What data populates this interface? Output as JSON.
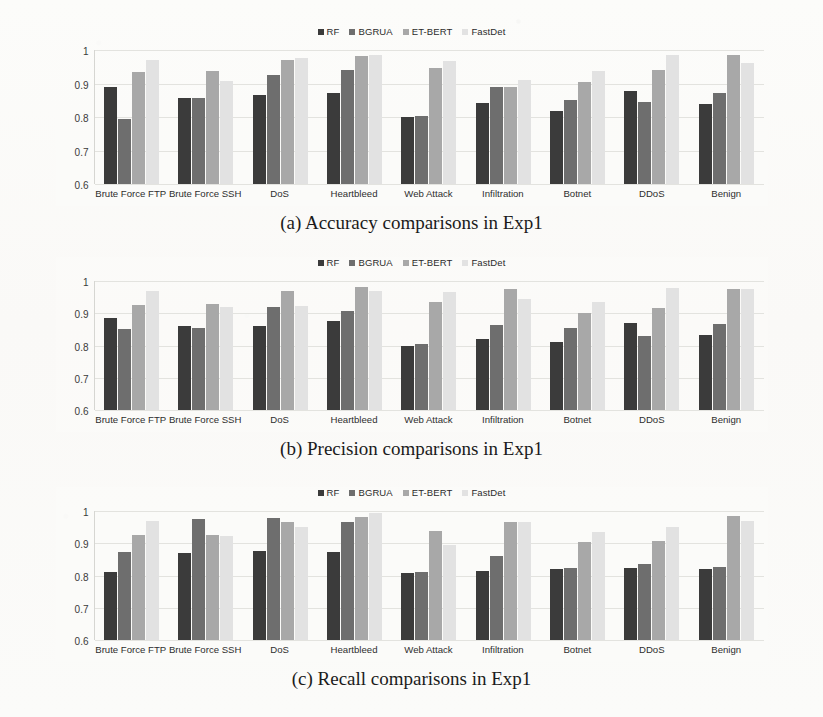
{
  "figure": {
    "series_names": [
      "RF",
      "BGRUA",
      "ET-BERT",
      "FastDet"
    ],
    "series_colors": [
      "#3b3b3b",
      "#6e6e6e",
      "#a8a8a8",
      "#e2e2e2"
    ],
    "categories": [
      "Brute Force FTP",
      "Brute Force SSH",
      "DoS",
      "Heartbleed",
      "Web Attack",
      "Infiltration",
      "Botnet",
      "DDoS",
      "Benign"
    ],
    "yticks": [
      "1",
      "0.9",
      "0.8",
      "0.7",
      "0.6"
    ],
    "captions": {
      "a": "(a) Accuracy comparisons in Exp1",
      "b": "(b) Precision comparisons in Exp1",
      "c": "(c) Recall comparisons in Exp1"
    }
  },
  "chart_data": [
    {
      "type": "bar",
      "title": "(a) Accuracy comparisons in Exp1",
      "xlabel": "",
      "ylabel": "",
      "ylim": [
        0.6,
        1.0
      ],
      "grid": true,
      "legend_position": "top-center",
      "categories": [
        "Brute Force FTP",
        "Brute Force SSH",
        "DoS",
        "Heartbleed",
        "Web Attack",
        "Infiltration",
        "Botnet",
        "DDoS",
        "Benign"
      ],
      "series": [
        {
          "name": "RF",
          "values": [
            0.89,
            0.858,
            0.865,
            0.872,
            0.799,
            0.841,
            0.817,
            0.877,
            0.838
          ]
        },
        {
          "name": "BGRUA",
          "values": [
            0.795,
            0.857,
            0.925,
            0.94,
            0.804,
            0.891,
            0.851,
            0.846,
            0.871
          ]
        },
        {
          "name": "ET-BERT",
          "values": [
            0.934,
            0.938,
            0.97,
            0.981,
            0.946,
            0.891,
            0.906,
            0.94,
            0.985
          ]
        },
        {
          "name": "FastDet",
          "values": [
            0.97,
            0.909,
            0.975,
            0.984,
            0.966,
            0.91,
            0.936,
            0.984,
            0.962
          ]
        }
      ]
    },
    {
      "type": "bar",
      "title": "(b) Precision comparisons in Exp1",
      "xlabel": "",
      "ylabel": "",
      "ylim": [
        0.6,
        1.0
      ],
      "grid": true,
      "legend_position": "top-center",
      "categories": [
        "Brute Force FTP",
        "Brute Force SSH",
        "DoS",
        "Heartbleed",
        "Web Attack",
        "Infiltration",
        "Botnet",
        "DDoS",
        "Benign"
      ],
      "series": [
        {
          "name": "RF",
          "values": [
            0.885,
            0.86,
            0.861,
            0.875,
            0.8,
            0.821,
            0.811,
            0.871,
            0.832
          ]
        },
        {
          "name": "BGRUA",
          "values": [
            0.852,
            0.855,
            0.92,
            0.906,
            0.806,
            0.863,
            0.854,
            0.828,
            0.868
          ]
        },
        {
          "name": "ET-BERT",
          "values": [
            0.925,
            0.93,
            0.97,
            0.982,
            0.935,
            0.975,
            0.902,
            0.915,
            0.974
          ]
        },
        {
          "name": "FastDet",
          "values": [
            0.97,
            0.92,
            0.922,
            0.968,
            0.967,
            0.943,
            0.935,
            0.978,
            0.974
          ]
        }
      ]
    },
    {
      "type": "bar",
      "title": "(c) Recall comparisons in Exp1",
      "xlabel": "",
      "ylabel": "",
      "ylim": [
        0.6,
        1.0
      ],
      "grid": true,
      "legend_position": "top-center",
      "categories": [
        "Brute Force FTP",
        "Brute Force SSH",
        "DoS",
        "Heartbleed",
        "Web Attack",
        "Infiltration",
        "Botnet",
        "DDoS",
        "Benign"
      ],
      "series": [
        {
          "name": "RF",
          "values": [
            0.812,
            0.871,
            0.877,
            0.872,
            0.808,
            0.815,
            0.82,
            0.824,
            0.82
          ]
        },
        {
          "name": "BGRUA",
          "values": [
            0.872,
            0.975,
            0.979,
            0.966,
            0.812,
            0.862,
            0.822,
            0.836,
            0.826
          ]
        },
        {
          "name": "ET-BERT",
          "values": [
            0.927,
            0.927,
            0.965,
            0.98,
            0.937,
            0.965,
            0.903,
            0.908,
            0.985
          ]
        },
        {
          "name": "FastDet",
          "values": [
            0.97,
            0.922,
            0.95,
            0.995,
            0.894,
            0.967,
            0.936,
            0.95,
            0.969
          ]
        }
      ]
    }
  ]
}
